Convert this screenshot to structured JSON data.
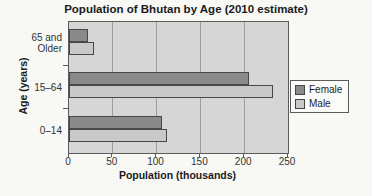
{
  "chart_data": {
    "type": "bar",
    "orientation": "horizontal",
    "title": "Population of Bhutan by Age (2010 estimate)",
    "xlabel": "Population (thousands)",
    "ylabel": "Age (years)",
    "categories": [
      "65 and Older",
      "15–64",
      "0–14"
    ],
    "series": [
      {
        "name": "Female",
        "color": "#8a8a8a",
        "values": [
          22,
          206,
          106
        ]
      },
      {
        "name": "Male",
        "color": "#c9c9c9",
        "values": [
          28,
          233,
          112
        ]
      }
    ],
    "xlim": [
      0,
      250
    ],
    "xticks": [
      0,
      50,
      100,
      150,
      200,
      250
    ],
    "grid": true,
    "legend_position": "right",
    "plot_background": "#d6d6d6",
    "gridline_color": "#9c9c9c",
    "bar_border_color": "#484848"
  }
}
